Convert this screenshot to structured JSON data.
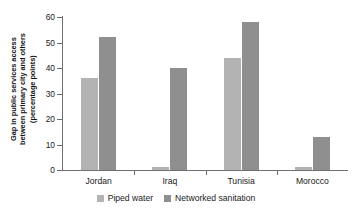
{
  "chart_data": {
    "type": "bar",
    "title": "",
    "subtitle": "",
    "xlabel": "",
    "ylabel_lines": [
      "Gap in public services access",
      "between primary city and others",
      "(percentage points)"
    ],
    "ylabel": "Gap in public services access between primary city and others (percentage points)",
    "categories": [
      "Jordan",
      "Iraq",
      "Tunisia",
      "Morocco"
    ],
    "series": [
      {
        "name": "Piped water",
        "color": "#b3b3b3",
        "values": [
          36,
          1,
          44,
          1
        ]
      },
      {
        "name": "Networked sanitation",
        "color": "#8f8f8f",
        "values": [
          52,
          40,
          58,
          13
        ]
      }
    ],
    "ylim": [
      0,
      60
    ],
    "ytick_labels": [
      "0",
      "10",
      "20",
      "30",
      "40",
      "50",
      "60"
    ],
    "ytick_values": [
      0,
      10,
      20,
      30,
      40,
      50,
      60
    ],
    "grid": false,
    "legend_position": "bottom-center",
    "legend_entries": [
      "Piped water",
      "Networked sanitation"
    ],
    "annotations": [],
    "axis_color": "#6f6f6f",
    "background_color": "#ffffff"
  }
}
